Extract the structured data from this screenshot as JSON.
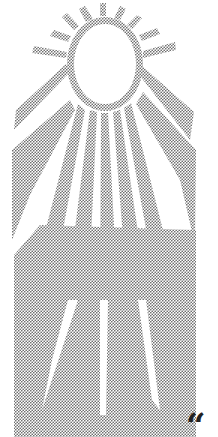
{
  "illustration": {
    "subject": "halftone sun with rays",
    "dot_color": "#7a7a7a",
    "background": "#ffffff"
  },
  "quote_mark": "“"
}
